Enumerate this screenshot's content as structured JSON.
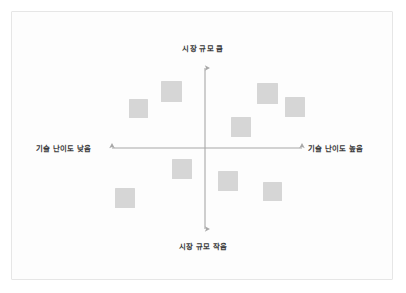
{
  "diagram": {
    "type": "quadrant-matrix",
    "background_color": "#ffffff",
    "card_background_color": "#fdfdfd",
    "card_border_color": "#e6e6e6",
    "axis_color": "#a8a8a8",
    "item_color": "#d6d6d6",
    "label_color": "#3a3a3a"
  },
  "axes": {
    "vertical": {
      "top_label": "시장 규모 큼",
      "bottom_label": "시장 규모 작음",
      "name": "시장 규모"
    },
    "horizontal": {
      "left_label": "기술 난이도 낮음",
      "right_label": "기술 난이도 높음",
      "name": "기술 난이도"
    }
  },
  "chart_data": {
    "type": "scatter",
    "title": "",
    "xlabel": "기술 난이도",
    "ylabel": "시장 규모",
    "xlim": [
      -1,
      1
    ],
    "ylim": [
      -1,
      1
    ],
    "grid": false,
    "legend": "none",
    "quadrant_labels": {
      "top": "시장 규모 큼",
      "bottom": "시장 규모 작음",
      "left": "기술 난이도 낮음",
      "right": "기술 난이도 높음"
    },
    "origin_px": {
      "x": 193,
      "y": 136
    },
    "points": [
      {
        "id": 1,
        "quadrant": "upper-left",
        "x_px": 117,
        "y_px": 87,
        "size_px": 19
      },
      {
        "id": 2,
        "quadrant": "upper-left",
        "x_px": 149,
        "y_px": 69,
        "size_px": 21
      },
      {
        "id": 3,
        "quadrant": "upper-right",
        "x_px": 245,
        "y_px": 71,
        "size_px": 21
      },
      {
        "id": 4,
        "quadrant": "upper-right",
        "x_px": 273,
        "y_px": 85,
        "size_px": 20
      },
      {
        "id": 5,
        "quadrant": "upper-right",
        "x_px": 219,
        "y_px": 105,
        "size_px": 20
      },
      {
        "id": 6,
        "quadrant": "lower-left",
        "x_px": 160,
        "y_px": 147,
        "size_px": 20
      },
      {
        "id": 7,
        "quadrant": "lower-left",
        "x_px": 103,
        "y_px": 176,
        "size_px": 20
      },
      {
        "id": 8,
        "quadrant": "lower-right",
        "x_px": 206,
        "y_px": 159,
        "size_px": 20
      },
      {
        "id": 9,
        "quadrant": "lower-right",
        "x_px": 251,
        "y_px": 170,
        "size_px": 19
      }
    ]
  }
}
